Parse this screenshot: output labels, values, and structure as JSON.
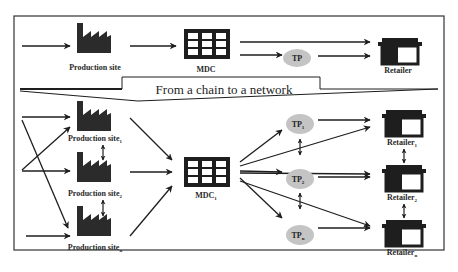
{
  "title": "From a chain to a network",
  "chain": {
    "production_site": "Production site",
    "mdc": "MDC",
    "tp": "TP",
    "retailer": "Retailer"
  },
  "network": {
    "production_sites": [
      {
        "label": "Production site",
        "sub": "1"
      },
      {
        "label": "Production site",
        "sub": "2"
      },
      {
        "label": "Production site",
        "sub": "n"
      }
    ],
    "mdc": {
      "label": "MDC",
      "sub": "1"
    },
    "tps": [
      {
        "label": "TP",
        "sub": "1"
      },
      {
        "label": "TP",
        "sub": "2"
      },
      {
        "label": "TP",
        "sub": "n"
      }
    ],
    "retailers": [
      {
        "label": "Retailer",
        "sub": "1"
      },
      {
        "label": "Retailer",
        "sub": "2"
      },
      {
        "label": "Retailer",
        "sub": "n"
      }
    ]
  },
  "colors": {
    "ink": "#1e1e1e",
    "tp_fill": "#c4c4c4",
    "frame": "#333333"
  }
}
